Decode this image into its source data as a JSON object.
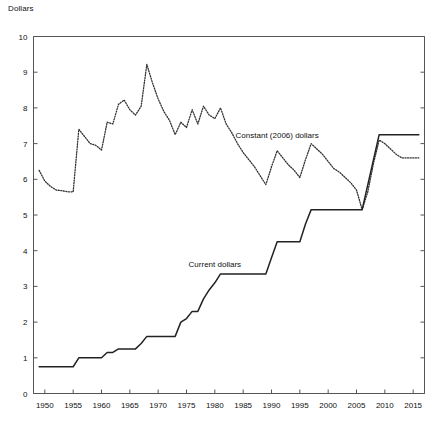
{
  "chart_data": {
    "type": "line",
    "title": "",
    "subtitle": "",
    "xlabel": "",
    "ylabel": "Dollars",
    "xlim": [
      1948,
      2017
    ],
    "ylim": [
      0,
      10
    ],
    "grid": false,
    "legend_position": "inline-annotations",
    "xticks": [
      "1950",
      "1955",
      "1960",
      "1965",
      "1970",
      "1975",
      "1980",
      "1985",
      "1990",
      "1995",
      "2000",
      "2005",
      "2010",
      "2015"
    ],
    "xtick_values": [
      1950,
      1955,
      1960,
      1965,
      1970,
      1975,
      1980,
      1985,
      1990,
      1995,
      2000,
      2005,
      2010,
      2015
    ],
    "yticks": [
      "0",
      "1",
      "2",
      "3",
      "4",
      "5",
      "6",
      "7",
      "8",
      "9",
      "10"
    ],
    "ytick_values": [
      0,
      1,
      2,
      3,
      4,
      5,
      6,
      7,
      8,
      9,
      10
    ],
    "series": [
      {
        "name": "Current dollars",
        "style": "solid",
        "color": "#222222",
        "label_x": 1980,
        "label_y": 3.55,
        "x": [
          1949,
          1950,
          1951,
          1952,
          1953,
          1954,
          1955,
          1956,
          1957,
          1958,
          1959,
          1960,
          1961,
          1962,
          1963,
          1964,
          1965,
          1966,
          1967,
          1968,
          1969,
          1970,
          1971,
          1972,
          1973,
          1974,
          1975,
          1976,
          1977,
          1978,
          1979,
          1980,
          1981,
          1982,
          1983,
          1984,
          1985,
          1986,
          1987,
          1988,
          1989,
          1990,
          1991,
          1992,
          1993,
          1994,
          1995,
          1996,
          1997,
          1998,
          1999,
          2000,
          2001,
          2002,
          2003,
          2004,
          2005,
          2006,
          2007,
          2008,
          2009,
          2010,
          2011,
          2012,
          2013,
          2014,
          2015,
          2016
        ],
        "values": [
          0.75,
          0.75,
          0.75,
          0.75,
          0.75,
          0.75,
          0.75,
          1.0,
          1.0,
          1.0,
          1.0,
          1.0,
          1.15,
          1.15,
          1.25,
          1.25,
          1.25,
          1.25,
          1.4,
          1.6,
          1.6,
          1.6,
          1.6,
          1.6,
          1.6,
          2.0,
          2.1,
          2.3,
          2.3,
          2.65,
          2.9,
          3.1,
          3.35,
          3.35,
          3.35,
          3.35,
          3.35,
          3.35,
          3.35,
          3.35,
          3.35,
          3.8,
          4.25,
          4.25,
          4.25,
          4.25,
          4.25,
          4.75,
          5.15,
          5.15,
          5.15,
          5.15,
          5.15,
          5.15,
          5.15,
          5.15,
          5.15,
          5.15,
          5.85,
          6.55,
          7.25,
          7.25,
          7.25,
          7.25,
          7.25,
          7.25,
          7.25,
          7.25
        ]
      },
      {
        "name": "Constant (2006) dollars",
        "style": "dotted",
        "color": "#333333",
        "label_x": 1991,
        "label_y": 7.15,
        "x": [
          1949,
          1950,
          1951,
          1952,
          1953,
          1954,
          1955,
          1956,
          1957,
          1958,
          1959,
          1960,
          1961,
          1962,
          1963,
          1964,
          1965,
          1966,
          1967,
          1968,
          1969,
          1970,
          1971,
          1972,
          1973,
          1974,
          1975,
          1976,
          1977,
          1978,
          1979,
          1980,
          1981,
          1982,
          1983,
          1984,
          1985,
          1986,
          1987,
          1988,
          1989,
          1990,
          1991,
          1992,
          1993,
          1994,
          1995,
          1996,
          1997,
          1998,
          1999,
          2000,
          2001,
          2002,
          2003,
          2004,
          2005,
          2006,
          2007,
          2008,
          2009,
          2010,
          2011,
          2012,
          2013,
          2014,
          2015,
          2016
        ],
        "values": [
          6.25,
          5.95,
          5.8,
          5.7,
          5.68,
          5.65,
          5.65,
          7.4,
          7.2,
          7.0,
          6.95,
          6.82,
          7.6,
          7.55,
          8.1,
          8.22,
          7.95,
          7.8,
          8.05,
          9.22,
          8.7,
          8.25,
          7.9,
          7.65,
          7.25,
          7.6,
          7.45,
          7.95,
          7.55,
          8.05,
          7.8,
          7.7,
          8.0,
          7.55,
          7.3,
          7.0,
          6.75,
          6.55,
          6.35,
          6.1,
          5.85,
          6.35,
          6.8,
          6.6,
          6.4,
          6.25,
          6.05,
          6.55,
          7.0,
          6.85,
          6.7,
          6.5,
          6.3,
          6.2,
          6.05,
          5.9,
          5.7,
          5.15,
          5.65,
          6.45,
          7.1,
          7.0,
          6.85,
          6.7,
          6.6,
          6.6,
          6.6,
          6.6
        ]
      }
    ],
    "annotations": [
      {
        "text": "Current dollars",
        "x": 1980,
        "y": 3.55
      },
      {
        "text": "Constant (2006) dollars",
        "x": 1991,
        "y": 7.15
      }
    ]
  },
  "axis": {
    "y_title": "Dollars"
  }
}
